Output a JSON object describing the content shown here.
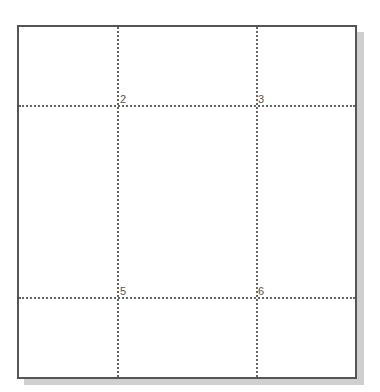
{
  "grid": {
    "vertical_lines_x": [
      117,
      256
    ],
    "horizontal_lines_y": [
      105,
      297
    ],
    "labels": [
      {
        "text": "2",
        "x": 120,
        "y": 94
      },
      {
        "text": "3",
        "x": 258,
        "y": 94
      },
      {
        "text": "5",
        "x": 120,
        "y": 286
      },
      {
        "text": "6",
        "x": 258,
        "y": 286
      }
    ]
  },
  "colors": {
    "border": "#555555",
    "gridline": "#666666",
    "shadow": "#cfcfcf",
    "label": "#555555"
  }
}
